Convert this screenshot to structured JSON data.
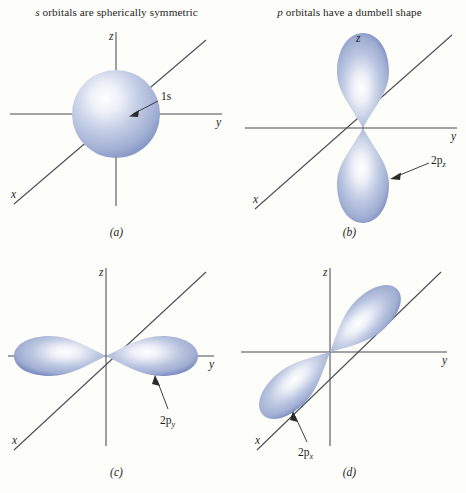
{
  "figure": {
    "headings": {
      "s": {
        "italic": "s",
        "rest": " orbitals are spherically symmetric"
      },
      "p": {
        "italic": "p",
        "rest": " orbitals have a dumbell shape"
      }
    },
    "panels": [
      {
        "id": "a",
        "caption": "(a)",
        "orbital_label": "1s",
        "orbital_label_base": "1s",
        "orbital_label_sub": "",
        "orbital_type": "sphere",
        "axes": [
          {
            "name": "z-axis",
            "label": "z"
          },
          {
            "name": "y-axis",
            "label": "y"
          },
          {
            "name": "x-axis",
            "label": "x"
          }
        ]
      },
      {
        "id": "b",
        "caption": "(b)",
        "orbital_label": "2pz",
        "orbital_label_base": "2p",
        "orbital_label_sub": "z",
        "orbital_type": "dumbbell-vertical",
        "axes": [
          {
            "name": "z-axis",
            "label": "z"
          },
          {
            "name": "y-axis",
            "label": "y"
          },
          {
            "name": "x-axis",
            "label": "x"
          }
        ]
      },
      {
        "id": "c",
        "caption": "(c)",
        "orbital_label": "2py",
        "orbital_label_base": "2p",
        "orbital_label_sub": "y",
        "orbital_type": "dumbbell-horizontal",
        "axes": [
          {
            "name": "z-axis",
            "label": "z"
          },
          {
            "name": "y-axis",
            "label": "y"
          },
          {
            "name": "x-axis",
            "label": "x"
          }
        ]
      },
      {
        "id": "d",
        "caption": "(d)",
        "orbital_label": "2px",
        "orbital_label_base": "2p",
        "orbital_label_sub": "x",
        "orbital_type": "dumbbell-diagonal",
        "axes": [
          {
            "name": "z-axis",
            "label": "z"
          },
          {
            "name": "y-axis",
            "label": "y"
          },
          {
            "name": "x-axis",
            "label": "x"
          }
        ]
      }
    ],
    "colors": {
      "background": "#fdfdfa",
      "axis": "#4a4a52",
      "orbital_light": "#fbfcfe",
      "orbital_mid": "#aebada",
      "orbital_edge": "#7f90bc",
      "text": "#1d1d1d"
    }
  }
}
